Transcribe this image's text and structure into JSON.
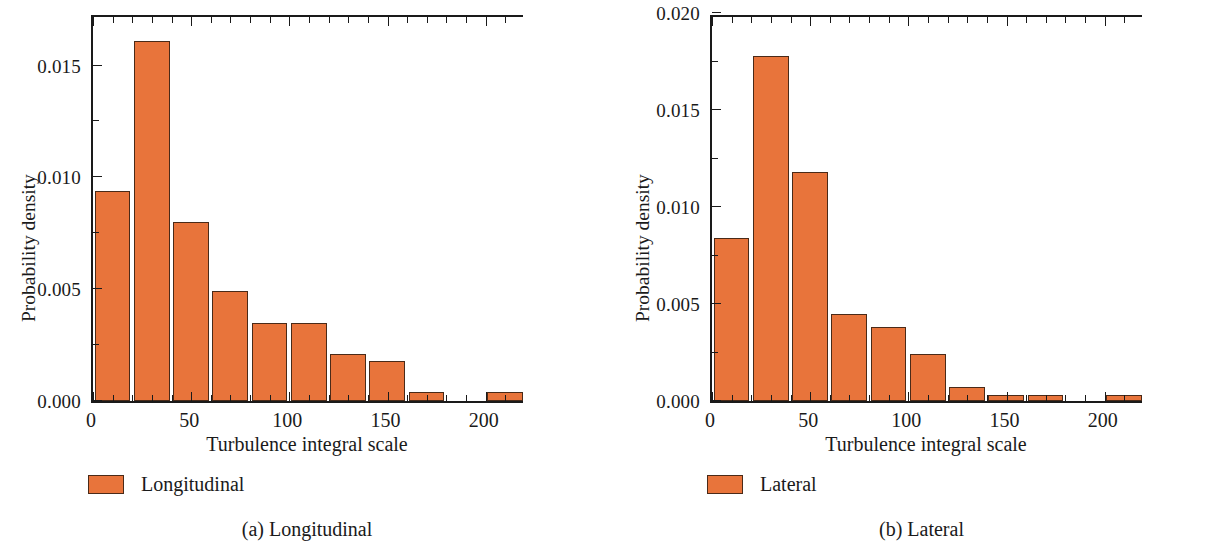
{
  "figure": {
    "bar_color": "#e8743b",
    "bar_edge_color": "#4a2a18",
    "axis_color": "#1a1a1a"
  },
  "panels": [
    {
      "key": "longitudinal",
      "caption": "(a)  Longitudinal",
      "legend_label": "Longitudinal",
      "axis_title_y": "Probability density",
      "axis_title_x": "Turbulence integral scale",
      "ytick_labels": [
        "0.000",
        "0.005",
        "0.010",
        "0.015"
      ],
      "xtick_labels": [
        "0",
        "50",
        "100",
        "150",
        "200"
      ]
    },
    {
      "key": "lateral",
      "caption": "(b)  Lateral",
      "legend_label": "Lateral",
      "axis_title_y": "Probability density",
      "axis_title_x": "Turbulence integral scale",
      "ytick_labels": [
        "0.000",
        "0.005",
        "0.010",
        "0.015",
        "0.020"
      ],
      "xtick_labels": [
        "0",
        "50",
        "100",
        "150",
        "200"
      ]
    }
  ],
  "chart_data": [
    {
      "type": "bar",
      "title": "(a)  Longitudinal",
      "xlabel": "Turbulence integral scale",
      "ylabel": "Probability density",
      "legend": [
        "Longitudinal"
      ],
      "legend_position": "below-axes-left",
      "grid": false,
      "xlim": [
        0,
        220
      ],
      "ylim": [
        0,
        0.01735
      ],
      "xticks": [
        0,
        50,
        100,
        150,
        200
      ],
      "xticks_minor": [
        10,
        20,
        30,
        40,
        60,
        70,
        80,
        90,
        110,
        120,
        130,
        140,
        160,
        170,
        180,
        190,
        210
      ],
      "yticks": [
        0.0,
        0.005,
        0.01,
        0.015
      ],
      "yticks_minor": [
        0.0025,
        0.0075,
        0.0125,
        0.0175
      ],
      "bin_width": 20,
      "bin_edges": [
        0,
        20,
        40,
        60,
        80,
        100,
        120,
        140,
        160,
        180,
        200,
        220
      ],
      "bin_centers": [
        10,
        30,
        50,
        70,
        90,
        110,
        130,
        150,
        170,
        190,
        210
      ],
      "categories": [
        "0-20",
        "20-40",
        "40-60",
        "60-80",
        "80-100",
        "100-120",
        "120-140",
        "140-160",
        "160-180",
        "180-200",
        "200-220"
      ],
      "values": [
        0.0094,
        0.0161,
        0.008,
        0.0049,
        0.0035,
        0.0035,
        0.0021,
        0.0018,
        0.0004,
        0.0,
        0.0004
      ]
    },
    {
      "type": "bar",
      "title": "(b)  Lateral",
      "xlabel": "Turbulence integral scale",
      "ylabel": "Probability density",
      "legend": [
        "Lateral"
      ],
      "legend_position": "below-axes-left",
      "grid": false,
      "xlim": [
        0,
        220
      ],
      "ylim": [
        0,
        0.02
      ],
      "xticks": [
        0,
        50,
        100,
        150,
        200
      ],
      "xticks_minor": [
        10,
        20,
        30,
        40,
        60,
        70,
        80,
        90,
        110,
        120,
        130,
        140,
        160,
        170,
        180,
        190,
        210
      ],
      "yticks": [
        0.0,
        0.005,
        0.01,
        0.015,
        0.02
      ],
      "yticks_minor": [
        0.0025,
        0.0075,
        0.0125,
        0.0175
      ],
      "bin_width": 20,
      "bin_edges": [
        0,
        20,
        40,
        60,
        80,
        100,
        120,
        140,
        160,
        180,
        200,
        220
      ],
      "bin_centers": [
        10,
        30,
        50,
        70,
        90,
        110,
        130,
        150,
        170,
        190,
        210
      ],
      "categories": [
        "0-20",
        "20-40",
        "40-60",
        "60-80",
        "80-100",
        "100-120",
        "120-140",
        "140-160",
        "160-180",
        "180-200",
        "200-220"
      ],
      "values": [
        0.0084,
        0.0178,
        0.0118,
        0.0045,
        0.0038,
        0.0024,
        0.0007,
        0.0003,
        0.0003,
        0.0,
        0.0003
      ]
    }
  ]
}
